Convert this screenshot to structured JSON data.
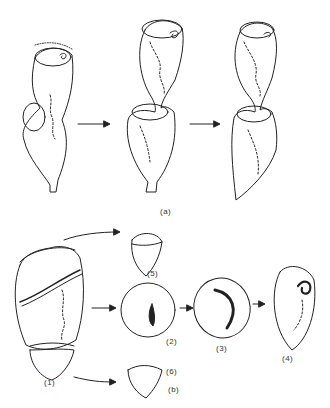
{
  "figure": {
    "panel_a": {
      "label": "(a)",
      "stages": [
        "left cell with budding anterior",
        "middle cell pinching",
        "right cell separating"
      ]
    },
    "panel_b": {
      "label": "(b)",
      "fragments": [
        {
          "id": "1",
          "label": "(1)"
        },
        {
          "id": "2",
          "label": "(2)"
        },
        {
          "id": "3",
          "label": "(3)"
        },
        {
          "id": "4",
          "label": "(4)"
        },
        {
          "id": "5",
          "label": "(5)"
        },
        {
          "id": "6",
          "label": "(6)"
        }
      ]
    },
    "colors": {
      "ink": "#222222",
      "background": "#ffffff"
    }
  }
}
